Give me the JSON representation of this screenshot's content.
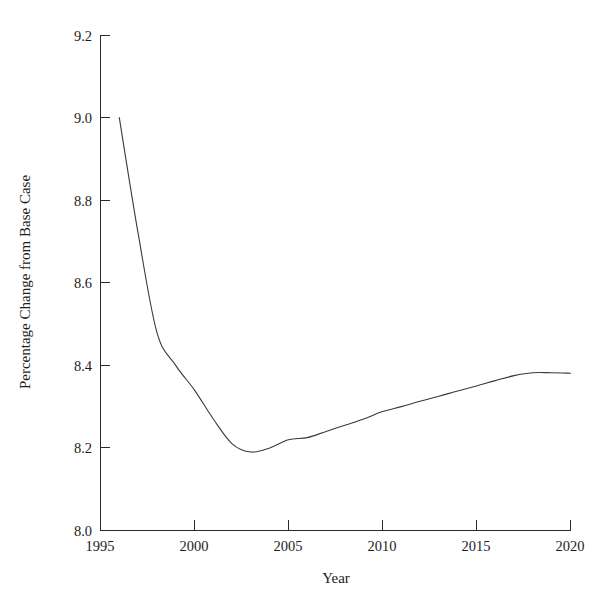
{
  "chart_data": {
    "type": "line",
    "title": "",
    "xlabel": "Year",
    "ylabel": "Percentage Change from Base Case",
    "xlim": [
      1995,
      2020
    ],
    "ylim": [
      8.0,
      9.2
    ],
    "xticks": [
      1995,
      2000,
      2005,
      2010,
      2015,
      2020
    ],
    "xtick_labels": [
      "1995",
      "2000",
      "2005",
      "2010",
      "2015",
      "2020"
    ],
    "yticks": [
      8.0,
      8.2,
      8.4,
      8.6,
      8.8,
      9.0,
      9.2
    ],
    "ytick_labels": [
      "8.0",
      "8.2",
      "8.4",
      "8.6",
      "8.8",
      "9.0",
      "9.2"
    ],
    "grid": false,
    "legend": null,
    "line_color": "#3a3a3a",
    "line_width": 1.1,
    "x": [
      1996,
      1997,
      1998,
      1999,
      2000,
      2001,
      2002,
      2003,
      2004,
      2005,
      2006,
      2007,
      2008,
      2009,
      2010,
      2011,
      2012,
      2013,
      2014,
      2015,
      2016,
      2017,
      2018,
      2019,
      2020
    ],
    "values": [
      9.0,
      8.72,
      8.48,
      8.4,
      8.34,
      8.27,
      8.21,
      8.19,
      8.2,
      8.22,
      8.225,
      8.24,
      8.255,
      8.27,
      8.288,
      8.3,
      8.313,
      8.325,
      8.338,
      8.35,
      8.363,
      8.375,
      8.382,
      8.382,
      8.381
    ],
    "series": [
      {
        "name": "Percentage Change from Base Case",
        "values": [
          9.0,
          8.72,
          8.48,
          8.4,
          8.34,
          8.27,
          8.21,
          8.19,
          8.2,
          8.22,
          8.225,
          8.24,
          8.255,
          8.27,
          8.288,
          8.3,
          8.313,
          8.325,
          8.338,
          8.35,
          8.363,
          8.375,
          8.382,
          8.382,
          8.381
        ]
      }
    ],
    "annotations": {
      "start_point": "9.0 at 1996",
      "minimum": "8.19 at 2003",
      "end_point": "8.38 at 2020"
    }
  }
}
